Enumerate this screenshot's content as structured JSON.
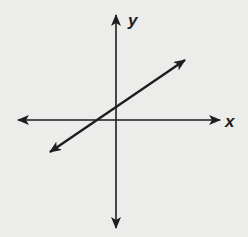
{
  "diagram": {
    "type": "coordinate-plane-line",
    "axes": {
      "x_label": "x",
      "y_label": "y",
      "arrows": "both-ends"
    },
    "line": {
      "slope_sign": "positive",
      "y_intercept_sign": "positive",
      "x_intercept_sign": "negative",
      "arrows": "both-ends"
    },
    "colors": {
      "ink": "#1e1e1e",
      "background": "#ececea"
    }
  }
}
